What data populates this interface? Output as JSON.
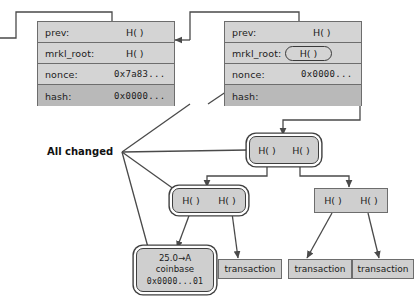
{
  "diagram": {
    "caption": {
      "all_changed": "All changed"
    },
    "colors": {
      "block_fill": "#d4d4d4",
      "row_dark_fill": "#b9b9b9",
      "node_fill": "#cfcfcf",
      "border": "#6d6d6d",
      "highlight_border": "#3f3f3f",
      "wire": "#4a4a4a",
      "text": "#1b1b1b"
    },
    "blocks": [
      {
        "id": "block-left",
        "rows": [
          {
            "key": "prev:",
            "value": "H( )",
            "highlighted": false,
            "dark": false,
            "mono": false
          },
          {
            "key": "mrkl_root:",
            "value": "H( )",
            "highlighted": false,
            "dark": false,
            "mono": false
          },
          {
            "key": "nonce:",
            "value": "0x7a83...",
            "highlighted": false,
            "dark": false,
            "mono": true
          },
          {
            "key": "hash:",
            "value": "0x0000...",
            "highlighted": false,
            "dark": true,
            "mono": true
          }
        ]
      },
      {
        "id": "block-right",
        "rows": [
          {
            "key": "prev:",
            "value": "H( )",
            "highlighted": false,
            "dark": false,
            "mono": false
          },
          {
            "key": "mrkl_root:",
            "value": "H( )",
            "highlighted": true,
            "dark": false,
            "mono": false
          },
          {
            "key": "nonce:",
            "value": "0x0000...",
            "highlighted": false,
            "dark": false,
            "mono": true
          },
          {
            "key": "hash:",
            "value": "",
            "highlighted": false,
            "dark": true,
            "mono": true
          }
        ]
      }
    ],
    "merkle": {
      "root": {
        "id": "merkle-root",
        "left_label": "H( )",
        "right_label": "H( )",
        "changed": true
      },
      "mid_left": {
        "id": "merkle-mid-left",
        "left_label": "H( )",
        "right_label": "H( )",
        "changed": true
      },
      "mid_right": {
        "id": "merkle-mid-right",
        "left_label": "H( )",
        "right_label": "H( )",
        "changed": false
      }
    },
    "leaves": {
      "coinbase": {
        "id": "coinbase-tx",
        "amount": "25.0→A",
        "type": "coinbase",
        "hash": "0x0000...01",
        "changed": true
      },
      "transactions": [
        {
          "id": "transaction-1",
          "label": "transaction"
        },
        {
          "id": "transaction-2",
          "label": "transaction"
        },
        {
          "id": "transaction-3",
          "label": "transaction"
        }
      ]
    }
  }
}
